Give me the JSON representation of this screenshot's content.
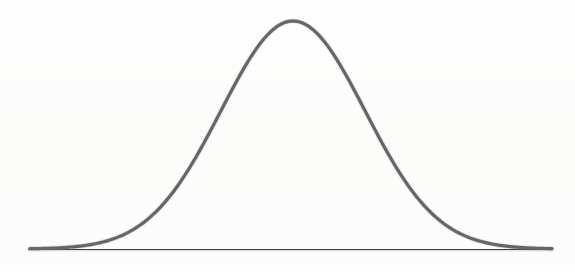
{
  "figure": {
    "kind": "scanned-diagram",
    "background_color": "#fdfdfc",
    "width": 575,
    "height": 272,
    "title": "",
    "caption": ""
  },
  "style": {
    "curve_color": "#5c5c5c",
    "curve_width_px": 3.2,
    "axis_color": "#3a3a3a",
    "axis_width_px": 1.2
  },
  "chart_data": {
    "type": "line",
    "title": "",
    "subtitle": "",
    "xlabel": "",
    "ylabel": "",
    "legend": [],
    "legend_position": "none",
    "grid": false,
    "annotations": [],
    "xlim": [
      -4.1,
      3.6
    ],
    "ylim": [
      0,
      1
    ],
    "distribution": {
      "name": "normal",
      "mean_px": 293,
      "sigma_px": 72,
      "peak_x_px": 293,
      "peak_y_px": 21,
      "baseline_y_px": 249,
      "curve_start_x_px": 30,
      "curve_end_x_px": 552
    },
    "axes": {
      "x_axis_line": {
        "x1_px": 28,
        "y1_px": 249.5,
        "x2_px": 553,
        "y2_px": 249.5,
        "tick_labels": [],
        "ticks": []
      },
      "y_axis_line": null
    },
    "x": [
      -4.1,
      -3.8,
      -3.5,
      -3.2,
      -2.9,
      -2.6,
      -2.3,
      -2.0,
      -1.7,
      -1.4,
      -1.1,
      -0.8,
      -0.5,
      -0.2,
      0.0,
      0.2,
      0.5,
      0.8,
      1.1,
      1.4,
      1.7,
      2.0,
      2.3,
      2.6,
      2.9,
      3.2,
      3.6
    ],
    "series": [
      {
        "name": "normal-pdf",
        "values": [
          0.0,
          0.002,
          0.005,
          0.006,
          0.015,
          0.033,
          0.069,
          0.135,
          0.237,
          0.375,
          0.546,
          0.726,
          0.882,
          0.98,
          1.0,
          0.98,
          0.882,
          0.726,
          0.546,
          0.375,
          0.237,
          0.135,
          0.069,
          0.033,
          0.015,
          0.006,
          0.0
        ]
      }
    ]
  }
}
